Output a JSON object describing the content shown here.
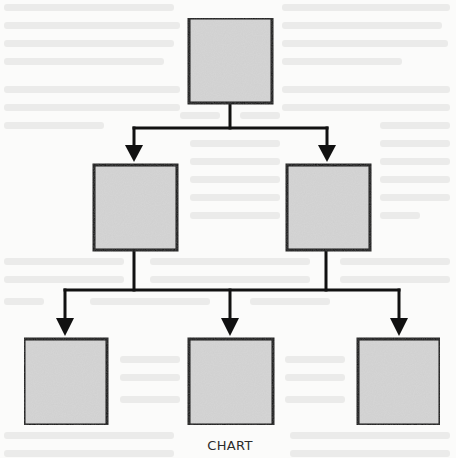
{
  "caption": "CHART",
  "colors": {
    "background": "#fbfbfa",
    "box_fill": "#d4d4d4",
    "stroke": "#111111",
    "caption": "#2b2b2b"
  },
  "diagram": {
    "type": "hierarchy-tree",
    "levels": 3,
    "nodes": [
      {
        "id": "root",
        "level": 1,
        "x": 188,
        "y": 17,
        "w": 84,
        "h": 86,
        "label": ""
      },
      {
        "id": "mid-left",
        "level": 2,
        "x": 93,
        "y": 164,
        "w": 84,
        "h": 86,
        "label": ""
      },
      {
        "id": "mid-right",
        "level": 2,
        "x": 287,
        "y": 164,
        "w": 84,
        "h": 86,
        "label": ""
      },
      {
        "id": "bottom-left",
        "level": 3,
        "x": 23,
        "y": 338,
        "w": 84,
        "h": 87,
        "label": ""
      },
      {
        "id": "bottom-center",
        "level": 3,
        "x": 189,
        "y": 338,
        "w": 84,
        "h": 87,
        "label": ""
      },
      {
        "id": "bottom-right",
        "level": 3,
        "x": 357,
        "y": 338,
        "w": 84,
        "h": 87,
        "label": ""
      }
    ],
    "edges": [
      {
        "from": "root",
        "to": "mid-left"
      },
      {
        "from": "root",
        "to": "mid-right"
      },
      {
        "from": "mid-left",
        "to": "bottom-left"
      },
      {
        "from": "mid-left",
        "to": "bottom-center"
      },
      {
        "from": "mid-right",
        "to": "bottom-center"
      },
      {
        "from": "mid-right",
        "to": "bottom-right"
      }
    ]
  }
}
